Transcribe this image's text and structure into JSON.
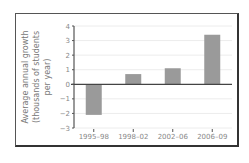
{
  "chart_data": {
    "type": "bar",
    "title": "",
    "xlabel": "",
    "ylabel": "Average annual growth (thousands of students per year)",
    "ylabel_lines": [
      "Average annual growth",
      "(thousands of students",
      "per year)"
    ],
    "categories": [
      "1995–98",
      "1998–02",
      "2002–06",
      "2006–09"
    ],
    "values": [
      -2.1,
      0.7,
      1.1,
      3.4
    ],
    "ylim": [
      -3,
      4
    ],
    "yticks": [
      -3,
      -2,
      -1,
      0,
      1,
      2,
      3,
      4
    ],
    "ytick_labels": [
      "−3",
      "−2",
      "−1",
      "0",
      "1",
      "2",
      "3",
      "4"
    ],
    "grid": true,
    "legend": null,
    "bar_color": "#9a9a9a"
  },
  "colors": {
    "bar": "#9a9a9a",
    "axis": "#555555",
    "zero_line": "#444444",
    "grid": "#ececec",
    "text": "#888888"
  }
}
